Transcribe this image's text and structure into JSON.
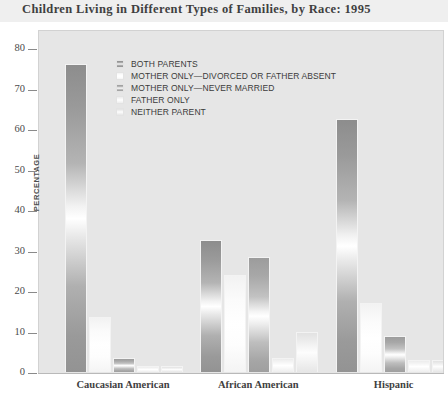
{
  "title": "Children Living in Different Types of Families, by Race: 1995",
  "axis": {
    "ylabel": "PERCENTAGE",
    "yticks": [
      "80",
      "70",
      "60",
      "50",
      "40",
      "30",
      "20",
      "10",
      "0"
    ],
    "xticks": [
      "Caucasian American",
      "African American",
      "Hispanic"
    ]
  },
  "legend": {
    "items": [
      {
        "label": "BOTH PARENTS",
        "swatch": "#919191"
      },
      {
        "label": "MOTHER ONLY—DIVORCED OR FATHER ABSENT",
        "swatch": "#fdfdfd"
      },
      {
        "label": "MOTHER ONLY—NEVER MARRIED",
        "swatch": "#a5a5a5"
      },
      {
        "label": "FATHER ONLY",
        "swatch": "#f0f0f0"
      },
      {
        "label": "NEITHER PARENT",
        "swatch": "#e4e4e4"
      }
    ]
  },
  "colors": {
    "title_band": "#efefef",
    "plot_background": "#e6e6e6",
    "axis_line": "#b9b9b9",
    "text": "#3f3f3f"
  },
  "chart_data": {
    "type": "bar",
    "title": "Children Living in Different Types of Families, by Race: 1995",
    "xlabel": "",
    "ylabel": "PERCENTAGE",
    "ylim": [
      0,
      80
    ],
    "ytick_step": 10,
    "grid": false,
    "legend_position": "inside-top-left",
    "categories": [
      "Caucasian American",
      "African American",
      "Hispanic"
    ],
    "series": [
      {
        "name": "BOTH PARENTS",
        "values": [
          76,
          32.5,
          62.5
        ]
      },
      {
        "name": "MOTHER ONLY—DIVORCED OR FATHER ABSENT",
        "values": [
          13.5,
          24,
          17
        ]
      },
      {
        "name": "MOTHER ONLY—NEVER MARRIED",
        "values": [
          3.5,
          28.5,
          9
        ]
      },
      {
        "name": "FATHER ONLY",
        "values": [
          1.5,
          3.5,
          3
        ]
      },
      {
        "name": "NEITHER PARENT",
        "values": [
          1.5,
          10,
          3
        ]
      }
    ]
  }
}
